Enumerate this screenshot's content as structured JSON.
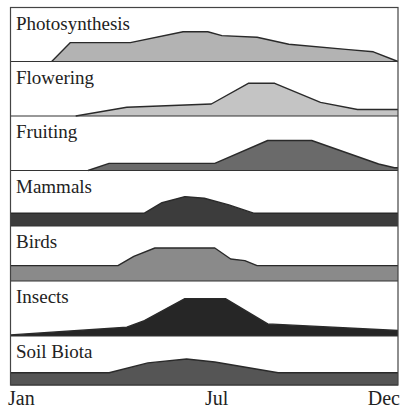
{
  "chart_data": {
    "type": "area",
    "title": "",
    "xlabel": "",
    "ylabel": "",
    "x_ticks": [
      {
        "label": "Jan",
        "month": 0
      },
      {
        "label": "Jul",
        "month": 6
      },
      {
        "label": "Dec",
        "month": 11
      }
    ],
    "x_range": [
      0,
      11
    ],
    "y_range": [
      0,
      1
    ],
    "grid": false,
    "legend": "none (panel labels inline)",
    "panels": [
      {
        "name": "Photosynthesis",
        "color": "#b3b3b3",
        "points": [
          [
            1.17,
            0
          ],
          [
            1.7,
            0.35
          ],
          [
            3.4,
            0.35
          ],
          [
            4.9,
            0.55
          ],
          [
            5.6,
            0.55
          ],
          [
            6.0,
            0.48
          ],
          [
            7.0,
            0.45
          ],
          [
            7.9,
            0.32
          ],
          [
            9.6,
            0.22
          ],
          [
            10.3,
            0.18
          ],
          [
            11,
            0
          ]
        ]
      },
      {
        "name": "Flowering",
        "color": "#c4c4c4",
        "points": [
          [
            1.85,
            0
          ],
          [
            3.3,
            0.16
          ],
          [
            5.7,
            0.22
          ],
          [
            6.75,
            0.6
          ],
          [
            7.5,
            0.6
          ],
          [
            8.8,
            0.25
          ],
          [
            9.85,
            0.12
          ],
          [
            11,
            0.12
          ]
        ]
      },
      {
        "name": "Fruiting",
        "color": "#6a6a6a",
        "points": [
          [
            2.2,
            0
          ],
          [
            2.8,
            0.13
          ],
          [
            5.8,
            0.13
          ],
          [
            7.3,
            0.55
          ],
          [
            8.55,
            0.55
          ],
          [
            10.45,
            0.12
          ],
          [
            10.9,
            0.05
          ],
          [
            11,
            0.05
          ]
        ]
      },
      {
        "name": "Mammals",
        "color": "#3c3c3c",
        "points": [
          [
            0,
            0.23
          ],
          [
            3.8,
            0.23
          ],
          [
            4.3,
            0.42
          ],
          [
            4.95,
            0.53
          ],
          [
            5.5,
            0.5
          ],
          [
            6.2,
            0.38
          ],
          [
            6.9,
            0.23
          ],
          [
            11,
            0.23
          ]
        ]
      },
      {
        "name": "Birds",
        "color": "#8a8a8a",
        "points": [
          [
            0,
            0.28
          ],
          [
            3.05,
            0.28
          ],
          [
            3.5,
            0.45
          ],
          [
            4.1,
            0.6
          ],
          [
            5.8,
            0.6
          ],
          [
            6.25,
            0.4
          ],
          [
            6.65,
            0.37
          ],
          [
            7.0,
            0.28
          ],
          [
            11,
            0.28
          ]
        ]
      },
      {
        "name": "Insects",
        "color": "#262626",
        "points": [
          [
            0,
            0.02
          ],
          [
            3.3,
            0.16
          ],
          [
            3.8,
            0.28
          ],
          [
            4.95,
            0.68
          ],
          [
            6.1,
            0.68
          ],
          [
            7.3,
            0.22
          ],
          [
            11,
            0.1
          ]
        ]
      },
      {
        "name": "Soil Biota",
        "color": "#555555",
        "points": [
          [
            0,
            0.25
          ],
          [
            2.8,
            0.25
          ],
          [
            3.9,
            0.45
          ],
          [
            5.0,
            0.53
          ],
          [
            5.8,
            0.47
          ],
          [
            7.6,
            0.25
          ],
          [
            11,
            0.25
          ]
        ]
      }
    ]
  },
  "labels": {
    "panels": [
      "Photosynthesis",
      "Flowering",
      "Fruiting",
      "Mammals",
      "Birds",
      "Insects",
      "Soil Biota"
    ],
    "x_axis": {
      "start": "Jan",
      "mid": "Jul",
      "end": "Dec"
    }
  }
}
